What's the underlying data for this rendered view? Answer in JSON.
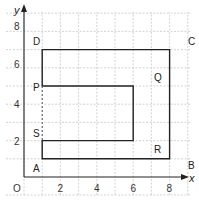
{
  "diagram": {
    "type": "coordinate-grid-shape",
    "axes": {
      "x_label": "x",
      "y_label": "y",
      "origin_label": "O",
      "x_ticks": [
        "2",
        "4",
        "6",
        "8"
      ],
      "y_ticks": [
        "2",
        "4",
        "6",
        "8"
      ],
      "x_range": [
        0,
        9.5
      ],
      "y_range": [
        0,
        8.5
      ],
      "grid": true
    },
    "points": [
      {
        "name": "A",
        "x": 1,
        "y": 1
      },
      {
        "name": "B",
        "x": 9,
        "y": 1
      },
      {
        "name": "C",
        "x": 9,
        "y": 7
      },
      {
        "name": "D",
        "x": 1,
        "y": 7
      },
      {
        "name": "P",
        "x": 1,
        "y": 5
      },
      {
        "name": "Q",
        "x": 7,
        "y": 5
      },
      {
        "name": "R",
        "x": 7,
        "y": 2
      },
      {
        "name": "S",
        "x": 1,
        "y": 2
      }
    ],
    "outline": [
      "A",
      "B",
      "C",
      "D",
      "P",
      "Q",
      "R",
      "S",
      "A"
    ],
    "dashed_segment": [
      "S",
      "P"
    ],
    "colors": {
      "grid": "#c8c8c8",
      "outline": "#222222",
      "axis": "#222222"
    }
  }
}
